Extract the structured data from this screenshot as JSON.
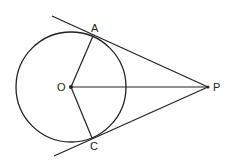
{
  "diagram": {
    "labels": {
      "A": "A",
      "O": "O",
      "P": "P",
      "C": "C"
    },
    "points": {
      "O": [
        71,
        87
      ],
      "A": [
        93,
        36
      ],
      "C": [
        92,
        138
      ],
      "P": [
        208,
        87
      ]
    },
    "circle": {
      "cx": 71,
      "cy": 87,
      "r": 55
    },
    "segments": [
      [
        "O",
        "A"
      ],
      [
        "O",
        "C"
      ],
      [
        "O",
        "P"
      ]
    ],
    "tangents": [
      {
        "from": [
          52,
          16
        ],
        "to": "P",
        "through": "A"
      },
      {
        "from": [
          54,
          156
        ],
        "to": "P",
        "through": "C"
      }
    ],
    "stroke_color": "#222222"
  }
}
